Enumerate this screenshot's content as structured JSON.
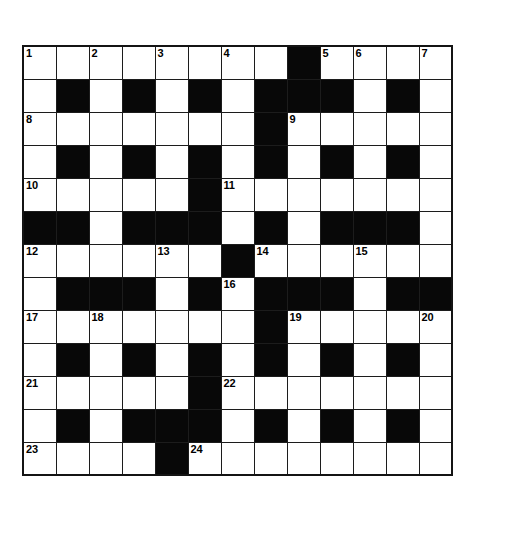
{
  "puzzle": {
    "title": "Crossword Grid",
    "type": "crossword",
    "rows": 13,
    "columns": 13,
    "cell_size_px": 33,
    "colors": {
      "white_cell": "#ffffff",
      "black_cell": "#080808",
      "grid_line": "#1c1c1c",
      "number_text": "#000000",
      "page_background": "#ffffff"
    },
    "numbers_present": [
      1,
      2,
      3,
      4,
      5,
      6,
      7,
      8,
      9,
      10,
      11,
      12,
      13,
      14,
      15,
      16,
      17,
      18,
      19,
      20,
      21,
      22,
      23,
      24
    ],
    "legend": {
      "1": "white (open) cell",
      "0": "black (blocked) cell"
    },
    "grid": [
      [
        1,
        1,
        1,
        1,
        1,
        1,
        1,
        1,
        0,
        1,
        1,
        1,
        1
      ],
      [
        1,
        0,
        1,
        0,
        1,
        0,
        1,
        0,
        0,
        0,
        1,
        0,
        1
      ],
      [
        1,
        1,
        1,
        1,
        1,
        1,
        1,
        0,
        1,
        1,
        1,
        1,
        1
      ],
      [
        1,
        0,
        1,
        0,
        1,
        0,
        1,
        0,
        1,
        0,
        1,
        0,
        1
      ],
      [
        1,
        1,
        1,
        1,
        1,
        0,
        1,
        1,
        1,
        1,
        1,
        1,
        1
      ],
      [
        0,
        0,
        1,
        0,
        0,
        0,
        1,
        0,
        1,
        0,
        0,
        0,
        1
      ],
      [
        1,
        1,
        1,
        1,
        1,
        1,
        0,
        1,
        1,
        1,
        1,
        1,
        1
      ],
      [
        1,
        0,
        0,
        0,
        1,
        0,
        1,
        0,
        0,
        0,
        1,
        0,
        0
      ],
      [
        1,
        1,
        1,
        1,
        1,
        1,
        1,
        0,
        1,
        1,
        1,
        1,
        1
      ],
      [
        1,
        0,
        1,
        0,
        1,
        0,
        1,
        0,
        1,
        0,
        1,
        0,
        1
      ],
      [
        1,
        1,
        1,
        1,
        1,
        0,
        1,
        1,
        1,
        1,
        1,
        1,
        1
      ],
      [
        1,
        0,
        1,
        0,
        0,
        0,
        1,
        0,
        1,
        0,
        1,
        0,
        1
      ],
      [
        1,
        1,
        1,
        1,
        0,
        1,
        1,
        1,
        1,
        1,
        1,
        1,
        1
      ]
    ],
    "numbered_cells": [
      {
        "number": "1",
        "row": 0,
        "col": 0
      },
      {
        "number": "2",
        "row": 0,
        "col": 2
      },
      {
        "number": "3",
        "row": 0,
        "col": 4
      },
      {
        "number": "4",
        "row": 0,
        "col": 6
      },
      {
        "number": "5",
        "row": 0,
        "col": 9
      },
      {
        "number": "6",
        "row": 0,
        "col": 10
      },
      {
        "number": "7",
        "row": 0,
        "col": 12
      },
      {
        "number": "8",
        "row": 2,
        "col": 0
      },
      {
        "number": "9",
        "row": 2,
        "col": 8
      },
      {
        "number": "10",
        "row": 4,
        "col": 0
      },
      {
        "number": "11",
        "row": 4,
        "col": 6
      },
      {
        "number": "12",
        "row": 6,
        "col": 0
      },
      {
        "number": "13",
        "row": 6,
        "col": 4
      },
      {
        "number": "14",
        "row": 6,
        "col": 7
      },
      {
        "number": "15",
        "row": 6,
        "col": 10
      },
      {
        "number": "16",
        "row": 7,
        "col": 6
      },
      {
        "number": "17",
        "row": 8,
        "col": 0
      },
      {
        "number": "18",
        "row": 8,
        "col": 2
      },
      {
        "number": "19",
        "row": 8,
        "col": 8
      },
      {
        "number": "20",
        "row": 8,
        "col": 12
      },
      {
        "number": "21",
        "row": 10,
        "col": 0
      },
      {
        "number": "22",
        "row": 10,
        "col": 6
      },
      {
        "number": "23",
        "row": 12,
        "col": 0
      },
      {
        "number": "24",
        "row": 12,
        "col": 5
      }
    ]
  }
}
